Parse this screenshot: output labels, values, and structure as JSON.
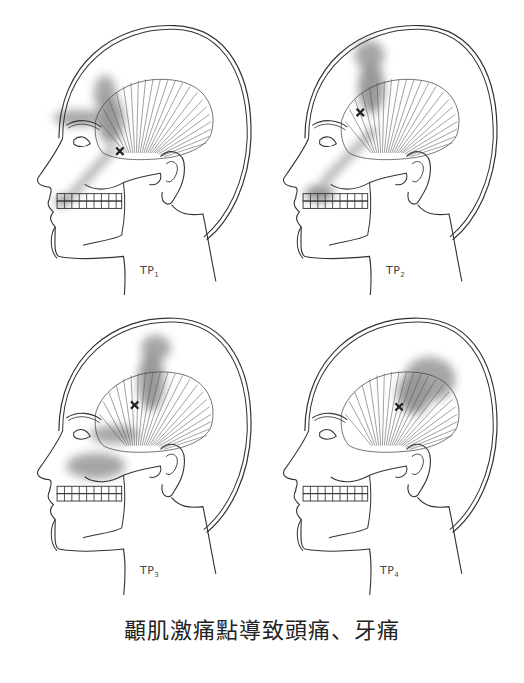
{
  "caption": "顳肌激痛點導致頭痛、牙痛",
  "panels": [
    {
      "id": "tp1",
      "label_main": "TP",
      "label_sub": "1",
      "pain_zones": [
        "eyebrow",
        "anterior temple",
        "upper incisors"
      ],
      "trigger_point": "anterior temporalis"
    },
    {
      "id": "tp2",
      "label_main": "TP",
      "label_sub": "2",
      "pain_zones": [
        "mid temple upward",
        "maxillary teeth"
      ],
      "trigger_point": "mid-anterior temporalis"
    },
    {
      "id": "tp3",
      "label_main": "TP",
      "label_sub": "3",
      "pain_zones": [
        "mid temple upward",
        "maxillary posterior teeth"
      ],
      "trigger_point": "middle temporalis"
    },
    {
      "id": "tp4",
      "label_main": "TP",
      "label_sub": "4",
      "pain_zones": [
        "posterior temple"
      ],
      "trigger_point": "posterior temporalis"
    }
  ],
  "colors": {
    "line": "#333333",
    "pain": "#7a7a7a",
    "marker": "#222222"
  }
}
